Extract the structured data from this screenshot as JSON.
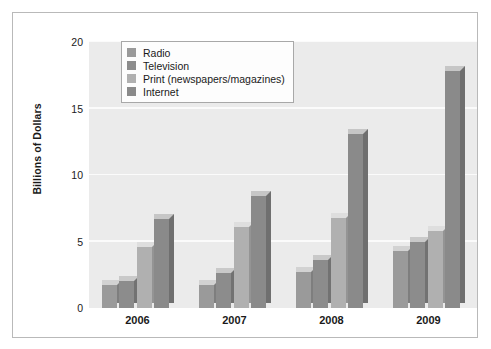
{
  "chart_data": {
    "type": "bar",
    "title": "",
    "xlabel": "",
    "ylabel": "Billions of Dollars",
    "categories": [
      "2006",
      "2007",
      "2008",
      "2009"
    ],
    "ylim": [
      0,
      20
    ],
    "yticks": [
      0,
      5,
      10,
      15,
      20
    ],
    "ytick_labels": [
      "0",
      "5",
      "10",
      "15",
      "20"
    ],
    "grid": true,
    "legend_position": "top-left-inside",
    "series": [
      {
        "name": "Radio",
        "color": "#9a9a9a",
        "side_color": "#7e7e7e",
        "top_color": "#d2d2d2",
        "values": [
          1.7,
          1.7,
          2.7,
          4.3
        ]
      },
      {
        "name": "Television",
        "color": "#8c8c8c",
        "side_color": "#727272",
        "top_color": "#c9c9c9",
        "values": [
          2.0,
          2.6,
          3.6,
          5.0
        ]
      },
      {
        "name": "Print (newspapers/magazines)",
        "color": "#b0b0b0",
        "side_color": "#949494",
        "top_color": "#dedede",
        "values": [
          4.6,
          6.1,
          6.8,
          5.8
        ]
      },
      {
        "name": "Internet",
        "color": "#8a8a8a",
        "side_color": "#6f6f6f",
        "top_color": "#c6c6c6",
        "values": [
          6.7,
          8.4,
          13.1,
          17.8
        ]
      }
    ]
  }
}
